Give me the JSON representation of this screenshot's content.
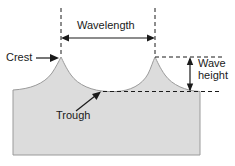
{
  "figure": {
    "labels": {
      "wavelength": "Wavelength",
      "crest": "Crest",
      "trough": "Trough",
      "wave_height_line1": "Wave",
      "wave_height_line2": "height"
    },
    "colors": {
      "water_fill": "#dcdcdc",
      "water_stroke": "#9a9a9a",
      "line": "#1a1a1a",
      "background": "#ffffff",
      "text": "#1a1a1a"
    },
    "geometry": {
      "crest_x_left": 61,
      "crest_x_right": 155,
      "crest_y": 57,
      "trough_y": 91,
      "water_left": 13,
      "water_right": 200,
      "water_bottom": 155,
      "wavelength_arrow_y": 38,
      "wave_height_arrow_x": 190,
      "crest_dash_line_right_x": 222
    },
    "annotations": [
      {
        "name": "wavelength-measure",
        "kind": "double-arrow-horizontal",
        "from_x": 61,
        "to_x": 155,
        "y": 38
      },
      {
        "name": "wave-height-measure",
        "kind": "double-arrow-vertical",
        "x": 190,
        "from_y": 58,
        "to_y": 91
      },
      {
        "name": "crest-pointer",
        "kind": "arrow",
        "from": [
          37,
          58
        ],
        "to": [
          58,
          58
        ]
      },
      {
        "name": "trough-pointer",
        "kind": "arrow",
        "from": [
          76,
          110
        ],
        "to": [
          100,
          92
        ]
      }
    ]
  }
}
